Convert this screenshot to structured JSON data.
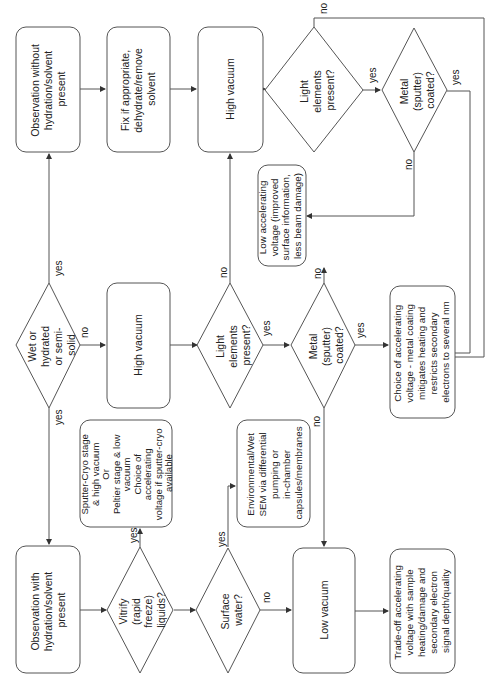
{
  "diagram": {
    "orientation": "rotated-90-ccw",
    "nodes": {
      "obs_without": {
        "type": "process",
        "lines": [
          "Observation without",
          "hydration/solvent",
          "present"
        ]
      },
      "fix": {
        "type": "process",
        "lines": [
          "Fix if appropriate,",
          "dehydrate/remove",
          "solvent"
        ]
      },
      "high_vac_top": {
        "type": "process",
        "lines": [
          "High vacuum"
        ]
      },
      "light_top": {
        "type": "decision",
        "lines": [
          "Light",
          "elements",
          "present?"
        ]
      },
      "metal_top": {
        "type": "decision",
        "lines": [
          "Metal",
          "(sputter)",
          "coated?"
        ]
      },
      "wet": {
        "type": "decision",
        "lines": [
          "Wet or",
          "hydrated",
          "or semi-",
          "solid"
        ]
      },
      "high_vac_mid": {
        "type": "process",
        "lines": [
          "High vacuum"
        ]
      },
      "light_mid": {
        "type": "decision",
        "lines": [
          "Light",
          "elements",
          "present?"
        ]
      },
      "metal_mid": {
        "type": "decision",
        "lines": [
          "Metal",
          "(sputter)",
          "coated?"
        ]
      },
      "low_kv": {
        "type": "process",
        "lines": [
          "Low accelerating",
          "voltage (improved",
          "surface information,",
          "less beam damage)"
        ]
      },
      "choice_kv": {
        "type": "process",
        "lines": [
          "Choice of accelerating",
          "voltage - metal coating",
          "mitigates heating and",
          "restricts secondary",
          "electrons to several nm"
        ]
      },
      "cryo": {
        "type": "process",
        "lines": [
          "Sputter-Cryo stage",
          "& high vacuum",
          "Or",
          "Peltier stage & low",
          "vacuum",
          "",
          "Choice of",
          "accelerating",
          "voltage if sputter-cryo",
          "available"
        ]
      },
      "esem": {
        "type": "process",
        "lines": [
          "Environmental/Wet",
          "SEM via differential",
          "pumping or",
          "in-chamber",
          "capsules/membranes"
        ]
      },
      "obs_with": {
        "type": "process",
        "lines": [
          "Observation with",
          "hydration/solvent",
          "present"
        ]
      },
      "vitrify": {
        "type": "decision",
        "lines": [
          "Vitrify",
          "(rapid",
          "freeze)",
          "liquids?"
        ]
      },
      "surface_water": {
        "type": "decision",
        "lines": [
          "Surface",
          "water?"
        ]
      },
      "low_vac": {
        "type": "process",
        "lines": [
          "Low vacuum"
        ]
      },
      "tradeoff": {
        "type": "process",
        "lines": [
          "Trade-off accelerating",
          "voltage with sample",
          "heating/damage and",
          "secondary electron",
          "signal depth/quality"
        ]
      }
    },
    "edge_labels": {
      "wet_yes_up": "yes",
      "wet_no": "no",
      "wet_yes_down": "yes",
      "light_top_no": "no",
      "light_top_yes": "yes",
      "metal_top_no": "no",
      "metal_top_yes": "yes",
      "light_mid_no": "no",
      "light_mid_yes": "yes",
      "metal_mid_no_up": "no",
      "metal_mid_yes": "yes",
      "metal_mid_no_down": "no",
      "vitrify_yes": "yes",
      "surface_yes": "yes",
      "surface_no": "no"
    },
    "colors": {
      "stroke": "#555555",
      "text": "#222222",
      "background": "#ffffff"
    }
  }
}
